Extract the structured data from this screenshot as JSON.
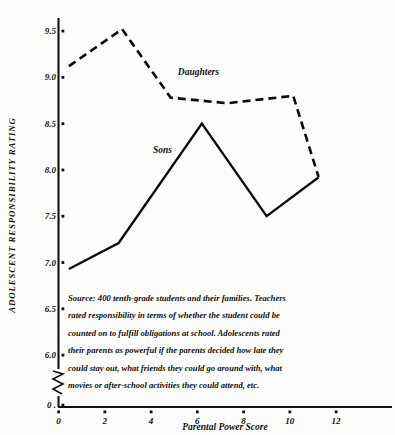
{
  "chart_data": {
    "type": "line",
    "title": "",
    "xlabel": "Parental Power Score",
    "ylabel": "ADOLESCENT RESPONSIBILITY RATING",
    "xlim": [
      0,
      13.3
    ],
    "ylim": [
      5.85,
      9.75
    ],
    "xticks": [
      0,
      2,
      4,
      6,
      8,
      10,
      12
    ],
    "xtick_labels": [
      "0",
      "2",
      "4",
      "6",
      "8",
      "10",
      "12"
    ],
    "yticks": [
      0,
      6.0,
      6.5,
      7.0,
      7.5,
      8.0,
      8.5,
      9.0,
      9.5
    ],
    "ytick_labels": [
      "0 .",
      "6.0",
      "6.5",
      "7.0",
      "7.5",
      "8.0",
      "8.5",
      "9.0",
      "9.5"
    ],
    "y_axis_break": true,
    "grid": false,
    "legend_position": "inline-annotations",
    "series": [
      {
        "name": "Daughters",
        "style": "dashed",
        "label_x": 6.05,
        "label_y": 9.03,
        "points": [
          {
            "x": 0.45,
            "y": 9.12
          },
          {
            "x": 2.75,
            "y": 9.52
          },
          {
            "x": 4.85,
            "y": 8.78
          },
          {
            "x": 7.3,
            "y": 8.72
          },
          {
            "x": 10.15,
            "y": 8.8
          },
          {
            "x": 11.25,
            "y": 7.92
          }
        ]
      },
      {
        "name": "Sons",
        "style": "solid",
        "label_x": 4.5,
        "label_y": 8.18,
        "points": [
          {
            "x": 0.45,
            "y": 6.93
          },
          {
            "x": 2.6,
            "y": 7.21
          },
          {
            "x": 6.2,
            "y": 8.5
          },
          {
            "x": 9.0,
            "y": 7.5
          },
          {
            "x": 11.25,
            "y": 7.92
          }
        ]
      }
    ],
    "source_note": {
      "lines": [
        "Source: 400 tenth-grade students and their families. Teachers",
        "rated responsibility in terms of whether the student could be",
        "counted on to fulfill obligations at school. Adolescents rated",
        "their parents as powerful if the parents decided how late they",
        "could stay out, what friends they could go around with, what",
        "movies or after-school activities they could attend, etc."
      ]
    }
  },
  "colors": {
    "ink": "#0a0a0a",
    "axis": "#111111",
    "background": "#fdfdfb"
  }
}
